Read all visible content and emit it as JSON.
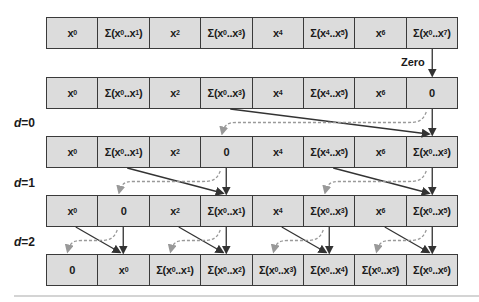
{
  "colors": {
    "cell_fill": "#dcdcdc",
    "cell_border": "#3a3a3a",
    "solid_arrow": "#333333",
    "dashed_arrow": "#999999"
  },
  "zero_label": "Zero",
  "levels": [
    {
      "label": "d=0"
    },
    {
      "label": "d=1"
    },
    {
      "label": "d=2"
    }
  ],
  "rows": [
    {
      "cells": [
        {
          "base": "x",
          "sub": "0"
        },
        {
          "sum": [
            "0",
            "1"
          ]
        },
        {
          "base": "x",
          "sub": "2"
        },
        {
          "sum": [
            "0",
            "3"
          ]
        },
        {
          "base": "x",
          "sub": "4"
        },
        {
          "sum": [
            "4",
            "5"
          ]
        },
        {
          "base": "x",
          "sub": "6"
        },
        {
          "sum": [
            "0",
            "7"
          ]
        }
      ]
    },
    {
      "cells": [
        {
          "base": "x",
          "sub": "0"
        },
        {
          "sum": [
            "0",
            "1"
          ]
        },
        {
          "base": "x",
          "sub": "2"
        },
        {
          "sum": [
            "0",
            "3"
          ]
        },
        {
          "base": "x",
          "sub": "4"
        },
        {
          "sum": [
            "4",
            "5"
          ]
        },
        {
          "base": "x",
          "sub": "6"
        },
        {
          "text": "0"
        }
      ]
    },
    {
      "cells": [
        {
          "base": "x",
          "sub": "0"
        },
        {
          "sum": [
            "0",
            "1"
          ]
        },
        {
          "base": "x",
          "sub": "2"
        },
        {
          "text": "0"
        },
        {
          "base": "x",
          "sub": "4"
        },
        {
          "sum": [
            "4",
            "5"
          ]
        },
        {
          "base": "x",
          "sub": "6"
        },
        {
          "sum": [
            "0",
            "3"
          ]
        }
      ]
    },
    {
      "cells": [
        {
          "base": "x",
          "sub": "0"
        },
        {
          "text": "0"
        },
        {
          "base": "x",
          "sub": "2"
        },
        {
          "sum": [
            "0",
            "1"
          ]
        },
        {
          "base": "x",
          "sub": "4"
        },
        {
          "sum": [
            "0",
            "3"
          ]
        },
        {
          "base": "x",
          "sub": "6"
        },
        {
          "sum": [
            "0",
            "5"
          ]
        }
      ]
    },
    {
      "cells": [
        {
          "text": "0"
        },
        {
          "base": "x",
          "sub": "0"
        },
        {
          "sum": [
            "0",
            "1"
          ]
        },
        {
          "sum": [
            "0",
            "2"
          ]
        },
        {
          "sum": [
            "0",
            "3"
          ]
        },
        {
          "sum": [
            "0",
            "4"
          ]
        },
        {
          "sum": [
            "0",
            "5"
          ]
        },
        {
          "sum": [
            "0",
            "6"
          ]
        }
      ]
    }
  ],
  "row_tops": [
    17,
    77,
    136,
    195,
    254
  ],
  "level_label_tops": [
    116,
    176,
    235
  ],
  "transitions": [
    {
      "from_row": 1,
      "pairs": [
        [
          3,
          7
        ]
      ]
    },
    {
      "from_row": 2,
      "pairs": [
        [
          1,
          3
        ],
        [
          5,
          7
        ]
      ]
    },
    {
      "from_row": 3,
      "pairs": [
        [
          0,
          1
        ],
        [
          2,
          3
        ],
        [
          4,
          5
        ],
        [
          6,
          7
        ]
      ]
    }
  ]
}
